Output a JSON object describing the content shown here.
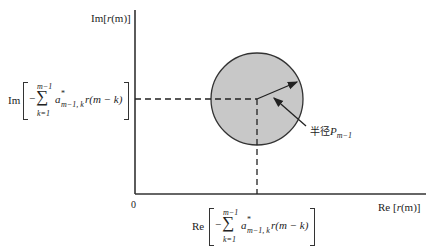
{
  "axes": {
    "y_label_prefix": "Im[",
    "y_label_var": "r",
    "y_label_arg": "(m)",
    "y_label_suffix": "]",
    "x_label_prefix": "Re [",
    "x_label_var": "r",
    "x_label_arg": "(m)",
    "x_label_suffix": "]",
    "origin": "0"
  },
  "im_projection": {
    "op": "Im",
    "minus": "−",
    "sum": "∑",
    "upper": "m−1",
    "lower": "k=1",
    "coef": "a",
    "coef_sup": "*",
    "coef_sub": "m−1, k",
    "term": "r(m − k)"
  },
  "re_projection": {
    "op": "Re",
    "minus": "−",
    "sum": "∑",
    "upper": "m−1",
    "lower": "k=1",
    "coef": "a",
    "coef_sup": "*",
    "coef_sub": "m−1, k",
    "term": "r(m − k)"
  },
  "circle": {
    "fill": "#c8c8c8",
    "stroke": "#333333",
    "radius_label": "半径",
    "radius_symbol": "P",
    "radius_sub": "m−1"
  }
}
